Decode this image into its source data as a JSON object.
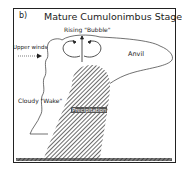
{
  "diagram": {
    "panel_label": "b)",
    "title": "Mature Cumulonimbus Stage",
    "labels": {
      "rising_bubble": "Rising \"Bubble\"",
      "upper_winds": "Upper winds",
      "anvil": "Anvil",
      "cloudy_wake": "Cloudy \"Wake\"",
      "precipitation": "Precipitation"
    },
    "colors": {
      "line": "#222222",
      "hatch": "#555555",
      "ground": "#444444",
      "background": "#ffffff"
    }
  }
}
